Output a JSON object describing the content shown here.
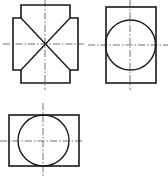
{
  "diagram": {
    "type": "orthographic-projection",
    "colors": {
      "line": "#1a1a1a",
      "centerline": "#333333",
      "background": "#ffffff"
    },
    "views": [
      {
        "id": "view-front",
        "position": "top-left",
        "shape": "cross-shaped outline with diagonal X lines",
        "outline_points": "21,5 70,5 70,18 78,18 78,70 70,70 70,83 21,83 21,70 13,70 13,18 21,18",
        "diagonals": [
          {
            "x1": 21,
            "y1": 18,
            "x2": 70,
            "y2": 70
          },
          {
            "x1": 70,
            "y1": 18,
            "x2": 21,
            "y2": 70
          }
        ],
        "centerlines": {
          "vertical": {
            "x": 45,
            "y1": 0,
            "y2": 90
          },
          "horizontal": {
            "y": 44,
            "x1": 3,
            "x2": 84
          }
        }
      },
      {
        "id": "view-side",
        "position": "top-right",
        "shape": "rectangle with inscribed circle",
        "rect": {
          "x": 106,
          "y": 7,
          "width": 50,
          "height": 76
        },
        "circle": {
          "cx": 130.5,
          "cy": 45,
          "r": 25
        },
        "centerlines": {
          "vertical": {
            "x": 130,
            "y1": 0,
            "y2": 90
          },
          "horizontal": {
            "y": 45,
            "x1": 88,
            "x2": 168
          }
        }
      },
      {
        "id": "view-top",
        "position": "bottom-left",
        "shape": "rectangle with inscribed circle",
        "rect": {
          "x": 9,
          "y": 115,
          "width": 70,
          "height": 51
        },
        "circle": {
          "cx": 43.5,
          "cy": 140.5,
          "r": 25.5
        },
        "centerlines": {
          "vertical": {
            "x": 43,
            "y1": 103,
            "y2": 178
          },
          "horizontal": {
            "y": 141,
            "x1": 0,
            "x2": 84
          }
        }
      }
    ]
  }
}
